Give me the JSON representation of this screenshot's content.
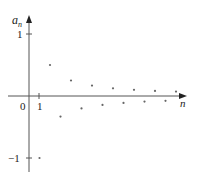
{
  "chart_data": {
    "type": "scatter",
    "title": "",
    "xlabel": "n",
    "ylabel": "a_n",
    "x_tick_labels": [
      "0",
      "1"
    ],
    "y_tick_labels": [
      "1",
      "-1"
    ],
    "xlim": [
      0,
      15
    ],
    "ylim": [
      -1.2,
      1.1
    ],
    "grid": false,
    "legend": null,
    "series": [
      {
        "name": "a_n",
        "x": [
          1,
          2,
          3,
          4,
          5,
          6,
          7,
          8,
          9,
          10,
          11,
          12,
          13,
          14
        ],
        "values": [
          -1,
          0.5,
          -0.333,
          0.25,
          -0.2,
          0.167,
          -0.143,
          0.125,
          -0.111,
          0.1,
          -0.091,
          0.083,
          -0.077,
          0.071
        ]
      }
    ]
  },
  "labels": {
    "y_axis_main": "a",
    "y_axis_sub": "n",
    "x_axis": "n",
    "origin": "0",
    "x_tick_one": "1",
    "y_tick_one": "1",
    "y_tick_minus_one": "−1"
  },
  "colors": {
    "axis": "#555555",
    "point": "#666666",
    "text": "#222222"
  }
}
